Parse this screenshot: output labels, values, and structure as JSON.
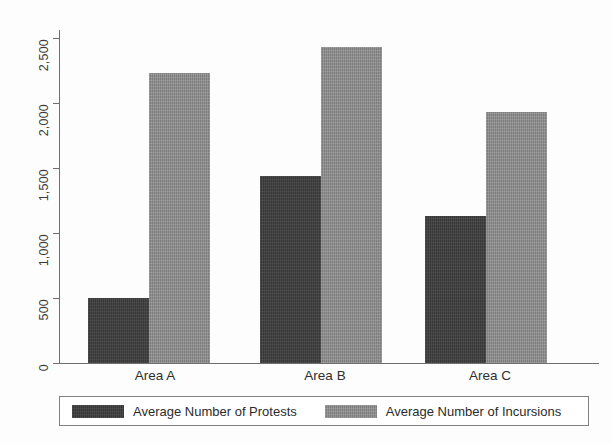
{
  "chart_data": {
    "type": "bar",
    "title": "",
    "subtitle": "",
    "xlabel": "",
    "ylabel": "",
    "categories": [
      "Area A",
      "Area B",
      "Area C"
    ],
    "series": [
      {
        "name": "Average Number of Protests",
        "color": "#3d3d3d",
        "values": [
          500,
          1440,
          1130
        ]
      },
      {
        "name": "Average Number of Incursions",
        "color": "#8b8b8b",
        "values": [
          2230,
          2430,
          1930
        ]
      }
    ],
    "ylim": [
      0,
      2500
    ],
    "y_ticks": [
      0,
      500,
      1000,
      1500,
      2000,
      2500
    ],
    "y_tick_labels": [
      "0",
      "500",
      "1,000",
      "1,500",
      "2,000",
      "2,500"
    ],
    "y_tick_label_rotation": 90,
    "grid": false,
    "legend_position": "bottom",
    "legend_entries": [
      "Average Number of Protests",
      "Average Number of Incursions"
    ],
    "annotations": []
  },
  "axis": {
    "y_labels": [
      "0",
      "500",
      "1,000",
      "1,500",
      "2,000",
      "2,500"
    ],
    "x_labels": [
      "Area A",
      "Area B",
      "Area C"
    ]
  },
  "legend": {
    "items": [
      {
        "label": "Average Number of Protests",
        "swatch": "dark-swatch"
      },
      {
        "label": "Average Number of Incursions",
        "swatch": "light-swatch"
      }
    ]
  }
}
